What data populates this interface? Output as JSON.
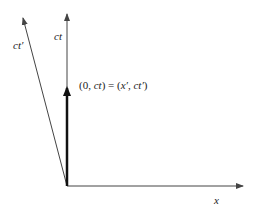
{
  "diagram": {
    "axes": {
      "ct_label": "ct",
      "ct_prime_label": "ct′",
      "x_label": "x"
    },
    "vector_label": {
      "open": "(0, ",
      "ct": "ct",
      "mid": ") = (",
      "xp": "x′",
      "comma": ", ",
      "ctp": "ct′",
      "close": ")"
    },
    "colors": {
      "axis": "#444444",
      "vector": "#111111",
      "text": "#222222"
    }
  }
}
